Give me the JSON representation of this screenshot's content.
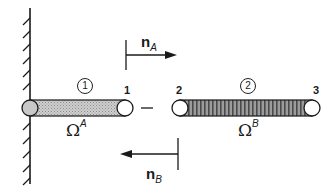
{
  "diagram": {
    "type": "two-body contact schematic",
    "wall": {
      "side": "left",
      "hatched": true
    },
    "bodies": [
      {
        "id": "A",
        "marker": "1",
        "domain_symbol": "Ω",
        "domain_superscript": "A",
        "fill": "light stipple gray",
        "end_node_label": "1"
      },
      {
        "id": "B",
        "marker": "2",
        "domain_symbol": "Ω",
        "domain_superscript": "B",
        "fill": "dark vertical hatching",
        "start_node_label": "2",
        "end_node_label": "3"
      }
    ],
    "gap": {
      "symbol": "–"
    },
    "normals": [
      {
        "symbol": "n",
        "subscript": "A",
        "direction": "right"
      },
      {
        "symbol": "n",
        "subscript": "B",
        "direction": "left"
      }
    ],
    "colors": {
      "line": "#1a1a1a",
      "bodyA_fill": "#bdbdbd",
      "bodyB_fill": "#7a7a7a",
      "background": "#ffffff"
    }
  }
}
